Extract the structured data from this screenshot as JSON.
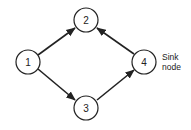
{
  "diagram": {
    "type": "directed-graph",
    "nodes": [
      {
        "id": "1",
        "label": "1",
        "x": 28,
        "y": 62
      },
      {
        "id": "2",
        "label": "2",
        "x": 86,
        "y": 20
      },
      {
        "id": "3",
        "label": "3",
        "x": 86,
        "y": 108
      },
      {
        "id": "4",
        "label": "4",
        "x": 144,
        "y": 62
      }
    ],
    "edges": [
      {
        "from": "1",
        "to": "2"
      },
      {
        "from": "1",
        "to": "3"
      },
      {
        "from": "3",
        "to": "4"
      },
      {
        "from": "4",
        "to": "2"
      }
    ],
    "annotation": {
      "line1": "Sink",
      "line2": "node",
      "target": "4"
    }
  }
}
